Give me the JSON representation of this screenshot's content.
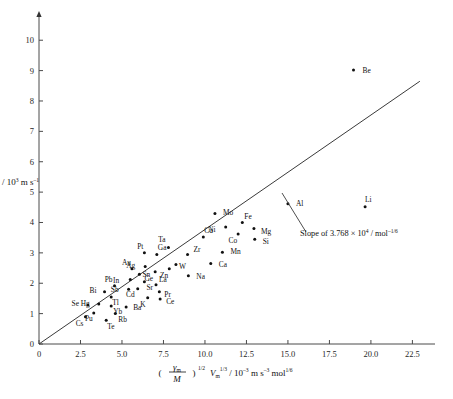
{
  "chart_data": {
    "type": "scatter",
    "title": "",
    "xlabel": "(γm/M)^1/2 Vm^1/3 / 10⁻³ m s⁻¹ mol^1/6",
    "ylabel": "Um / 10³ m s⁻¹",
    "xlim": [
      0,
      23.5
    ],
    "ylim": [
      0,
      10.6
    ],
    "xticks": [
      "0",
      "2.5",
      "5.0",
      "7.5",
      "10.0",
      "12.5",
      "15.0",
      "17.5",
      "20.0",
      "22.5"
    ],
    "xtickvalues": [
      0,
      2.5,
      5,
      7.5,
      10,
      12.5,
      15,
      17.5,
      20,
      22.5
    ],
    "yticks": [
      "0",
      "1",
      "2",
      "3",
      "4",
      "5",
      "6",
      "7",
      "8",
      "9",
      "10"
    ],
    "ytickvalues": [
      0,
      1,
      2,
      3,
      4,
      5,
      6,
      7,
      8,
      9,
      10
    ],
    "grid": false,
    "legend": null,
    "annotation": "Slope of 3.768 × 10⁴ / mol⁻¹ᐟ⁶",
    "annotation_slope_value": 3.768,
    "annotation_slope_exponent": 4,
    "fit_line": {
      "x0": 0,
      "y0": 0,
      "x1": 22.95,
      "y1": 8.65,
      "slope": 0.3768
    },
    "points": [
      {
        "label": "Be",
        "x": 18.95,
        "y": 9.02,
        "lx": 9,
        "ly": 3
      },
      {
        "label": "Li",
        "x": 19.65,
        "y": 4.52,
        "lx": 0,
        "ly": -5
      },
      {
        "label": "Al",
        "x": 15.0,
        "y": 4.62,
        "lx": 8,
        "ly": 2
      },
      {
        "label": "Mo",
        "x": 10.6,
        "y": 4.3,
        "lx": 8,
        "ly": 2
      },
      {
        "label": "Ni",
        "x": 11.25,
        "y": 3.85,
        "lx": -10,
        "ly": 5
      },
      {
        "label": "Fe",
        "x": 12.25,
        "y": 4.0,
        "lx": 2,
        "ly": -3
      },
      {
        "label": "Co",
        "x": 12.0,
        "y": 3.62,
        "lx": -1,
        "ly": 9
      },
      {
        "label": "Mg",
        "x": 12.95,
        "y": 3.8,
        "lx": 7,
        "ly": 5
      },
      {
        "label": "Si",
        "x": 13.0,
        "y": 3.45,
        "lx": 8,
        "ly": 5
      },
      {
        "label": "Mn",
        "x": 11.05,
        "y": 3.02,
        "lx": 8,
        "ly": 2
      },
      {
        "label": "Cu",
        "x": 9.9,
        "y": 3.52,
        "lx": 1,
        "ly": -4
      },
      {
        "label": "Ca",
        "x": 10.35,
        "y": 2.65,
        "lx": 8,
        "ly": 3
      },
      {
        "label": "Na",
        "x": 9.0,
        "y": 2.25,
        "lx": 8,
        "ly": 3
      },
      {
        "label": "Ta",
        "x": 7.8,
        "y": 3.18,
        "lx": -3,
        "ly": -5
      },
      {
        "label": "W",
        "x": 8.25,
        "y": 2.62,
        "lx": 3,
        "ly": 5
      },
      {
        "label": "Zn",
        "x": 7.85,
        "y": 2.48,
        "lx": -1,
        "ly": 9
      },
      {
        "label": "Ga",
        "x": 7.1,
        "y": 2.95,
        "lx": 1,
        "ly": -4
      },
      {
        "label": "Pt",
        "x": 6.35,
        "y": 3.0,
        "lx": -1,
        "ly": -4
      },
      {
        "label": "Ag",
        "x": 6.4,
        "y": 2.55,
        "lx": -10,
        "ly": 1
      },
      {
        "label": "Ge",
        "x": 7.0,
        "y": 2.38,
        "lx": -2,
        "ly": 9
      },
      {
        "label": "Au",
        "x": 5.6,
        "y": 2.48,
        "lx": -1,
        "ly": -4
      },
      {
        "label": "Sn",
        "x": 6.05,
        "y": 2.3,
        "lx": 3,
        "ly": 3
      },
      {
        "label": "Zr",
        "x": 8.95,
        "y": 2.95,
        "lx": 6,
        "ly": -2
      },
      {
        "label": "In",
        "x": 5.5,
        "y": 2.12,
        "lx": -11,
        "ly": 3
      },
      {
        "label": "Sr",
        "x": 6.35,
        "y": 2.05,
        "lx": 2,
        "ly": 8
      },
      {
        "label": "La",
        "x": 7.05,
        "y": 1.95,
        "lx": 3,
        "ly": -3
      },
      {
        "label": "Pr",
        "x": 7.25,
        "y": 1.72,
        "lx": 5,
        "ly": 5
      },
      {
        "label": "Ce",
        "x": 7.3,
        "y": 1.48,
        "lx": 6,
        "ly": 5
      },
      {
        "label": "K",
        "x": 6.55,
        "y": 1.52,
        "lx": -2,
        "ly": 9
      },
      {
        "label": "Cd",
        "x": 5.95,
        "y": 1.82,
        "lx": -3,
        "ly": 8
      },
      {
        "label": "Sb",
        "x": 5.4,
        "y": 1.8,
        "lx": -10,
        "ly": 3
      },
      {
        "label": "Pb",
        "x": 4.55,
        "y": 1.92,
        "lx": -2,
        "ly": -4
      },
      {
        "label": "Bi",
        "x": 3.95,
        "y": 1.72,
        "lx": -8,
        "ly": 1
      },
      {
        "label": "Tl",
        "x": 4.35,
        "y": 1.55,
        "lx": 1,
        "ly": 8
      },
      {
        "label": "Hg",
        "x": 3.6,
        "y": 1.32,
        "lx": -9,
        "ly": 2
      },
      {
        "label": "Yb",
        "x": 4.35,
        "y": 1.25,
        "lx": 2,
        "ly": 8
      },
      {
        "label": "Ba",
        "x": 5.25,
        "y": 1.22,
        "lx": 7,
        "ly": 3
      },
      {
        "label": "Se",
        "x": 2.95,
        "y": 1.28,
        "lx": -9,
        "ly": 1
      },
      {
        "label": "Pu",
        "x": 3.3,
        "y": 1.02,
        "lx": -1,
        "ly": 8
      },
      {
        "label": "Rb",
        "x": 4.6,
        "y": 1.0,
        "lx": 3,
        "ly": 8
      },
      {
        "label": "Te",
        "x": 4.05,
        "y": 0.78,
        "lx": 1,
        "ly": 9
      },
      {
        "label": "Cs",
        "x": 2.8,
        "y": 0.9,
        "lx": -2,
        "ly": 9
      }
    ]
  },
  "axes": {
    "y_title_var": "U",
    "y_title_sub": "m",
    "y_title_rest": " / 10",
    "y_title_exp": "3",
    "y_title_units": " m s",
    "y_title_units_exp": "–1",
    "x_gamma": "γ",
    "x_gamma_sub": "m",
    "x_M": "M",
    "x_paren_exp": "1/2",
    "x_V": "V",
    "x_V_sub": "m",
    "x_V_exp": "1/3",
    "x_rest": " / 10",
    "x_rest_exp": "–3",
    "x_units": " m s",
    "x_units_exp": "–3",
    "x_mol": " mol",
    "x_mol_exp": "1/6"
  },
  "annotation": {
    "text_part1": "Slope of 3.768 × 10",
    "exp1": "4",
    "text_part2": " / mol",
    "exp2": "–1/6"
  }
}
